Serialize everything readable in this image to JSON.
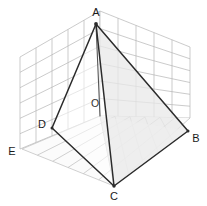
{
  "figure": {
    "type": "3d-geometry-diagram",
    "background_color": "#ffffff",
    "edge_color": "#2b2b2b",
    "grid_color": "#b4b4b4",
    "shade_color": "#e8e8e8",
    "width": 207,
    "height": 206
  },
  "labels": {
    "apex": "A",
    "base_right": "B",
    "base_front": "C",
    "base_left": "D",
    "center": "O",
    "origin_corner": "E"
  },
  "points": {
    "A": {
      "x": 96,
      "y": 24,
      "label": "A",
      "label_x": 96,
      "label_y": 13
    },
    "B": {
      "x": 188,
      "y": 131,
      "label": "B",
      "label_x": 196,
      "label_y": 139
    },
    "C": {
      "x": 114,
      "y": 186,
      "label": "C",
      "label_x": 114,
      "label_y": 197
    },
    "D": {
      "x": 52,
      "y": 128,
      "label": "D",
      "label_x": 42,
      "label_y": 125
    },
    "O": {
      "x": 100,
      "y": 116,
      "label": "O",
      "label_x": 95,
      "label_y": 104
    },
    "E": {
      "x": 22,
      "y": 149,
      "label": "E",
      "label_x": 12,
      "label_y": 152
    }
  },
  "edges": [
    {
      "name": "A-B",
      "from": "A",
      "to": "B",
      "style": "solid"
    },
    {
      "name": "A-C",
      "from": "A",
      "to": "C",
      "style": "solid"
    },
    {
      "name": "A-D",
      "from": "A",
      "to": "D",
      "style": "solid"
    },
    {
      "name": "B-C",
      "from": "B",
      "to": "C",
      "style": "solid"
    },
    {
      "name": "C-D",
      "from": "C",
      "to": "D",
      "style": "solid"
    },
    {
      "name": "A-O",
      "from": "A",
      "to": "O",
      "style": "altitude"
    }
  ],
  "faces": [
    {
      "name": "face-ABC",
      "shaded": true
    },
    {
      "name": "face-ACD",
      "shaded": false
    },
    {
      "name": "face-base-OCB",
      "shaded": true
    }
  ],
  "grid": {
    "left_wall": {
      "columns": 5,
      "rows": 6
    },
    "right_wall": {
      "columns": 5,
      "rows": 6
    },
    "floor": {
      "columns": 6,
      "rows": 6
    }
  }
}
